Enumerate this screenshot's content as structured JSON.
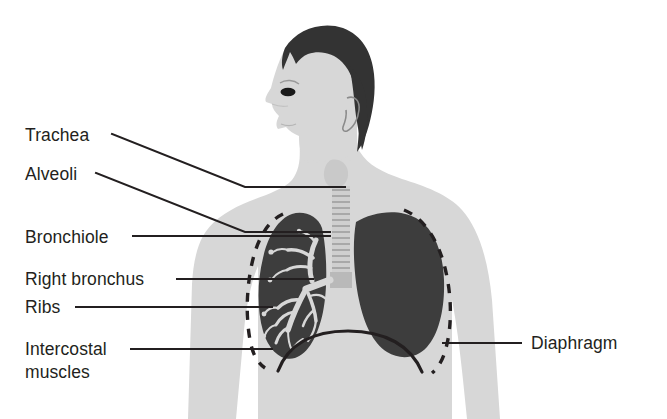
{
  "diagram": {
    "background_color": "#ffffff",
    "colors": {
      "body_fill": "#d7d7d7",
      "hair_fill": "#333333",
      "lung_dark": "#3d3d3d",
      "lung_light": "#d7d7d7",
      "trachea_fill": "#cfcfcf",
      "line_color": "#231f20",
      "text_color": "#231f20"
    },
    "labels": [
      {
        "id": "trachea",
        "text": "Trachea",
        "side": "left",
        "text_x": 25,
        "text_y": 141,
        "leader": "M 112 134 L 245 187 L 345 187"
      },
      {
        "id": "alveoli",
        "text": "Alveoli",
        "side": "left",
        "text_x": 25,
        "text_y": 180,
        "leader": "M 96 173 L 245 232 L 330 232"
      },
      {
        "id": "bronchiole",
        "text": "Bronchiole",
        "side": "left",
        "text_x": 25,
        "text_y": 243,
        "leader": "M 133 236 L 330 236"
      },
      {
        "id": "right-bronchus",
        "text": "Right bronchus",
        "side": "left",
        "text_x": 25,
        "text_y": 285,
        "leader": "M 177 279 L 313 279"
      },
      {
        "id": "ribs",
        "text": "Ribs",
        "side": "left",
        "text_x": 25,
        "text_y": 313,
        "leader": "M 76 307 L 272 307"
      },
      {
        "id": "intercostal-muscles",
        "text_line_1": "Intercostal",
        "text_line_2": "muscles",
        "side": "left",
        "text_x": 25,
        "text_y": 355,
        "text_y2": 378,
        "leader": "M 131 349 L 272 349"
      },
      {
        "id": "diaphragm",
        "text": "Diaphragm",
        "side": "right",
        "text_x": 531,
        "text_y": 349,
        "leader": "M 443 343 L 521 343"
      }
    ],
    "anatomy": [
      {
        "id": "head",
        "name": "head-profile"
      },
      {
        "id": "hair",
        "name": "hair"
      },
      {
        "id": "eye",
        "name": "eye"
      },
      {
        "id": "ear",
        "name": "ear"
      },
      {
        "id": "torso",
        "name": "torso"
      },
      {
        "id": "left-arm",
        "name": "left-arm"
      },
      {
        "id": "right-arm",
        "name": "right-arm"
      },
      {
        "id": "trachea",
        "name": "trachea-with-cartilage-rings"
      },
      {
        "id": "lung-left",
        "name": "lung-showing-bronchial-tree"
      },
      {
        "id": "lung-right",
        "name": "lung-solid"
      },
      {
        "id": "bronchial-tree",
        "name": "bronchial-tree"
      },
      {
        "id": "ribs-left",
        "name": "ribs-dashed-left"
      },
      {
        "id": "ribs-right",
        "name": "ribs-dashed-right"
      },
      {
        "id": "diaphragm-arc",
        "name": "diaphragm-arc"
      }
    ]
  }
}
